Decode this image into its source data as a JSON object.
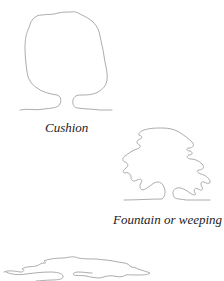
{
  "figure": {
    "shapes": [
      {
        "id": "cushion",
        "label": "Cushion"
      },
      {
        "id": "fountain",
        "label": "Fountain or weeping"
      },
      {
        "id": "flat",
        "label": ""
      }
    ],
    "colors": {
      "stroke": "#a3a3a3",
      "label": "#222222",
      "background": "#ffffff"
    }
  }
}
